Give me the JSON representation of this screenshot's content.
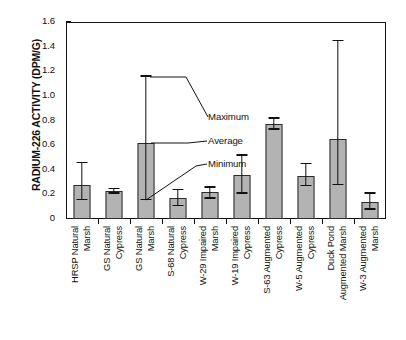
{
  "chart_data": {
    "type": "bar",
    "title": "",
    "xlabel": "",
    "ylabel": "RADIUM-226 ACTIVITY (DPM/G)",
    "ylim": [
      0,
      1.6
    ],
    "grid": false,
    "legend_position": "none",
    "y_ticks": [
      "0",
      "0.2",
      "0.4",
      "0.6",
      "0.8",
      "1.0",
      "1.2",
      "1.4",
      "1.6"
    ],
    "y_tick_values": [
      0,
      0.2,
      0.4,
      0.6,
      0.8,
      1.0,
      1.2,
      1.4,
      1.6
    ],
    "categories": [
      "HRSP Natural\nMarsh",
      "GS Natural\nCypress",
      "GS Natural\nMarsh",
      "S-68 Natural\nCypress",
      "W-29 Impaired\nMarsh",
      "W-19 Impaired\nCypress",
      "S-63 Augmented\nCypress",
      "W-5 Augmented\nCypress",
      "Duck Pond\nAugmented Marsh",
      "W-3 Augmented\nMarsh"
    ],
    "series": [
      {
        "name": "Average",
        "values": [
          0.28,
          0.23,
          0.62,
          0.17,
          0.22,
          0.36,
          0.77,
          0.35,
          0.65,
          0.14
        ]
      },
      {
        "name": "Maximum",
        "values": [
          0.46,
          0.25,
          1.16,
          0.24,
          0.26,
          0.52,
          0.82,
          0.45,
          1.45,
          0.21
        ]
      },
      {
        "name": "Minimum",
        "values": [
          0.16,
          0.21,
          0.16,
          0.11,
          0.17,
          0.21,
          0.73,
          0.27,
          0.28,
          0.08
        ]
      }
    ],
    "annotations": [
      {
        "label": "Maximum"
      },
      {
        "label": "Average"
      },
      {
        "label": "Minimum"
      }
    ],
    "colors": {
      "bar_fill": "#b3b3b3",
      "bar_stroke": "#2b2b2b",
      "axis": "#111111",
      "whisker": "#111111",
      "background": "#ffffff"
    }
  }
}
